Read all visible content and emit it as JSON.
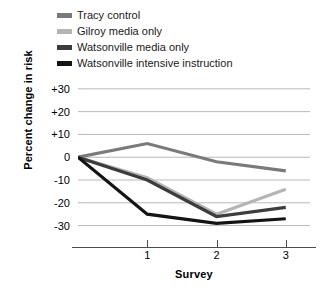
{
  "chart_data": {
    "type": "line",
    "title": "",
    "xlabel": "Survey",
    "ylabel": "Percent change in risk",
    "x": [
      0,
      1,
      2,
      3
    ],
    "x_tick_labels": [
      "1",
      "2",
      "3"
    ],
    "x_tick_values": [
      1,
      2,
      3
    ],
    "xlim": [
      0,
      3.35
    ],
    "ylim": [
      -35,
      33
    ],
    "y_ticks": [
      30,
      20,
      10,
      0,
      -10,
      -20,
      -30
    ],
    "y_tick_labels": [
      "+30",
      "+20",
      "+10",
      "0",
      "-10",
      "-20",
      "-30"
    ],
    "grid": true,
    "legend_position": "top-left",
    "series": [
      {
        "name": "Tracy control",
        "color": "#7a7a7a",
        "values": [
          0,
          6,
          -2,
          -6
        ]
      },
      {
        "name": "Gilroy media only",
        "color": "#b5b5b5",
        "values": [
          0,
          -9,
          -25,
          -14
        ]
      },
      {
        "name": "Watsonville media only",
        "color": "#3c3c3c",
        "values": [
          0,
          -10,
          -26,
          -22
        ]
      },
      {
        "name": "Watsonville intensive instruction",
        "color": "#141414",
        "values": [
          0,
          -25,
          -29,
          -27
        ]
      }
    ]
  },
  "legend": {
    "items": [
      {
        "label": "Tracy control",
        "color": "#7a7a7a"
      },
      {
        "label": "Gilroy media only",
        "color": "#b5b5b5"
      },
      {
        "label": "Watsonville media only",
        "color": "#3c3c3c"
      },
      {
        "label": "Watsonville intensive instruction",
        "color": "#141414"
      }
    ]
  },
  "axes": {
    "y_title": "Percent change in risk",
    "x_title": "Survey",
    "y_labels": [
      "+30",
      "+20",
      "+10",
      "0",
      "-10",
      "-20",
      "-30"
    ],
    "x_labels": [
      "1",
      "2",
      "3"
    ]
  },
  "colors": {
    "gridline": "#b9b9b9",
    "axis": "#4d4d4d",
    "text": "#000000"
  }
}
